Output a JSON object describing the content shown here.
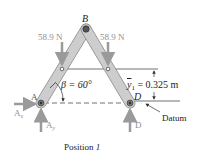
{
  "figure": {
    "caption": "Position ",
    "caption_num": "1",
    "colors": {
      "member_fill": "#c9c9c9",
      "member_stroke": "#8a8a8a",
      "arrow": "#9a9a9a",
      "text": "#222222",
      "force_text": "#8f8f8f",
      "line": "#333333"
    }
  },
  "labels": {
    "pin_top": "B",
    "pin_left": "A",
    "pin_right": "D",
    "pin_right_datum": "D",
    "force_left": "58.9 N",
    "force_right": "58.9 N",
    "angle": "β = 60°",
    "dimension_var": "y",
    "dimension_sub": "1",
    "dimension_value": " = 0.325 m",
    "datum": "Datum",
    "reaction_ax": "A",
    "reaction_ax_sub": "x",
    "reaction_ay": "A",
    "reaction_ay_sub": "y",
    "reaction_d": "D"
  }
}
